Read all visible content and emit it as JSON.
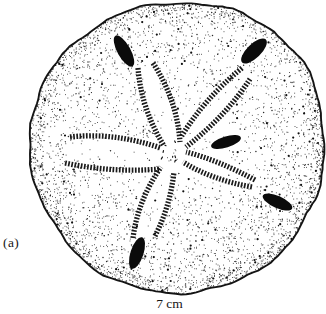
{
  "figure": {
    "panel_label": "(a)",
    "scale_label": "7 cm",
    "ink_color": "#1a1a1a",
    "spot_color": "#0b0b0b",
    "background_color": "#ffffff",
    "petal_count": 5,
    "dark_spot_count": 5
  },
  "illustration": {
    "center": [
      176,
      149
    ],
    "hub": [
      170.5,
      152.5
    ],
    "stipple_seed": 42,
    "outline_polar": [
      [
        -170.7,
        148
      ],
      [
        -160.7,
        148
      ],
      [
        -150.8,
        147.5
      ],
      [
        -140.8,
        147
      ],
      [
        -130.8,
        147
      ],
      [
        -121.3,
        146
      ],
      [
        -111.7,
        146
      ],
      [
        -101.1,
        145.5
      ],
      [
        -90.4,
        146
      ],
      [
        -74.7,
        148
      ],
      [
        -61.6,
        151
      ],
      [
        -49.8,
        153
      ],
      [
        -39.2,
        153.5
      ],
      [
        -28.9,
        153
      ],
      [
        -19,
        150
      ],
      [
        -7.3,
        149
      ],
      [
        4.3,
        147
      ],
      [
        16.1,
        148
      ],
      [
        28.8,
        147
      ],
      [
        40.6,
        147.5
      ],
      [
        52.5,
        146
      ],
      [
        63.9,
        146
      ],
      [
        76.4,
        144
      ],
      [
        88.4,
        144
      ],
      [
        100.4,
        144
      ],
      [
        112,
        144.5
      ],
      [
        123.1,
        144.5
      ],
      [
        134.4,
        144
      ],
      [
        145.7,
        144
      ],
      [
        157,
        143
      ],
      [
        168.5,
        145
      ],
      [
        178.8,
        147
      ]
    ],
    "petals": [
      {
        "name": "petal-nnw",
        "rows": [
          {
            "p0": [
              138,
              68
            ],
            "c": [
              141,
              108
            ],
            "p1": [
              164,
              146
            ]
          },
          {
            "p0": [
              153,
              63
            ],
            "c": [
              177,
              100
            ],
            "p1": [
              180,
              142
            ]
          }
        ]
      },
      {
        "name": "petal-ne",
        "rows": [
          {
            "p0": [
              242,
              68
            ],
            "c": [
              204,
              99
            ],
            "p1": [
              181,
              137
            ]
          },
          {
            "p0": [
              250,
              79
            ],
            "c": [
              226,
              116
            ],
            "p1": [
              186,
              147
            ]
          }
        ]
      },
      {
        "name": "petal-w",
        "rows": [
          {
            "p0": [
              70,
              137
            ],
            "c": [
              114,
              132
            ],
            "p1": [
              161,
              148
            ]
          },
          {
            "p0": [
              65,
              163
            ],
            "c": [
              112,
              173
            ],
            "p1": [
              160,
              169
            ]
          }
        ]
      },
      {
        "name": "petal-s",
        "rows": [
          {
            "p0": [
              133,
              238
            ],
            "c": [
              138,
              200
            ],
            "p1": [
              161,
              167
            ]
          },
          {
            "p0": [
              155,
              236
            ],
            "c": [
              170,
              207
            ],
            "p1": [
              174,
              172
            ]
          }
        ]
      },
      {
        "name": "petal-se",
        "rows": [
          {
            "p0": [
              255,
              180
            ],
            "c": [
              218,
              160
            ],
            "p1": [
              186,
              152
            ]
          },
          {
            "p0": [
              252,
              187
            ],
            "c": [
              212,
              180
            ],
            "p1": [
              183,
              162
            ]
          }
        ]
      }
    ],
    "spots": [
      {
        "cx": 124,
        "cy": 51,
        "rx": 17.5,
        "ry": 6.5,
        "rot": 61
      },
      {
        "cx": 254,
        "cy": 51,
        "rx": 16.5,
        "ry": 7,
        "rot": -44
      },
      {
        "cx": 226,
        "cy": 142,
        "rx": 15.5,
        "ry": 5.5,
        "rot": -17
      },
      {
        "cx": 277.5,
        "cy": 202,
        "rx": 16,
        "ry": 6,
        "rot": 24
      },
      {
        "cx": 137,
        "cy": 253,
        "rx": 16.5,
        "ry": 6.5,
        "rot": 108
      }
    ]
  }
}
